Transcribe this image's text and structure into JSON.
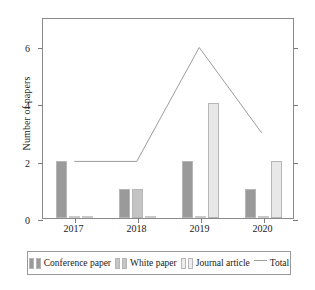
{
  "chart_data": {
    "type": "bar",
    "title": "",
    "xlabel": "",
    "ylabel": "Number of papers",
    "categories": [
      "2017",
      "2018",
      "2019",
      "2020"
    ],
    "ylim": [
      0,
      7
    ],
    "yticks": [
      0,
      2,
      4,
      6
    ],
    "grid": false,
    "legend_position": "bottom",
    "series": [
      {
        "name": "Conference paper",
        "type": "bar",
        "color": "#9a9a9a",
        "values": [
          2,
          1,
          2,
          1
        ]
      },
      {
        "name": "White paper",
        "type": "bar",
        "color": "#c4c4c4",
        "values": [
          0,
          1,
          0,
          0
        ]
      },
      {
        "name": "Journal article",
        "type": "bar",
        "color": "#e8e8e8",
        "values": [
          0,
          0,
          4,
          2
        ]
      },
      {
        "name": "Total",
        "type": "line",
        "color": "#9d9d9d",
        "values": [
          2,
          2,
          6,
          3
        ]
      }
    ]
  },
  "axis": {
    "y_title": "Number of papers",
    "y_tick_labels": [
      "0",
      "2",
      "4",
      "6"
    ],
    "x_tick_labels": [
      "2017",
      "2018",
      "2019",
      "2020"
    ]
  },
  "legend": {
    "items": [
      {
        "label": "Conference paper",
        "marker": "bar-swatch-dark"
      },
      {
        "label": "White paper",
        "marker": "bar-swatch-mid"
      },
      {
        "label": "Journal article",
        "marker": "bar-swatch-light"
      },
      {
        "label": "Total",
        "marker": "line-segment"
      }
    ]
  }
}
